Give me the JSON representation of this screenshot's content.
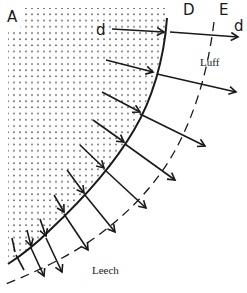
{
  "diagram": {
    "type": "sail airflow diagram",
    "labels": {
      "A": "A",
      "D": "D",
      "E": "E",
      "d_left": "d",
      "d_right": "d",
      "luff": "Luff",
      "leech": "Leech"
    },
    "colors": {
      "ink": "#1a1a1a",
      "stipple": "#555555",
      "background": "#ffffff"
    },
    "elements": {
      "stippled_region": "shaded sail area A",
      "solid_curve": "sail edge D",
      "dashed_curve": "displaced edge E",
      "arrow_count": 10
    }
  }
}
